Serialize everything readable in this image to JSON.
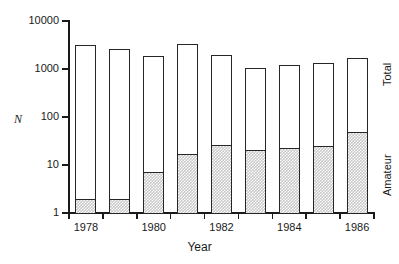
{
  "chart_data": {
    "type": "bar",
    "subtype": "stacked-bar-log-y",
    "title": "",
    "xlabel": "Year",
    "ylabel": "N",
    "ylabel_style": "italic",
    "yscale": "log",
    "ylim": [
      1,
      10000
    ],
    "ytick_labels": [
      "1",
      "10",
      "100",
      "1000",
      "10000"
    ],
    "ytick_values": [
      1,
      10,
      100,
      1000,
      10000
    ],
    "xtick_labels": [
      "1978",
      "1980",
      "1982",
      "1984",
      "1986"
    ],
    "xtick_values": [
      1978,
      1980,
      1982,
      1984,
      1986
    ],
    "categories": [
      1978,
      1979,
      1980,
      1981,
      1982,
      1983,
      1984,
      1985,
      1986
    ],
    "grid": false,
    "legend_position": "right-outside-rotated",
    "series": [
      {
        "name": "Total",
        "label": "Total",
        "fill": "#ffffff",
        "edge": "#262626",
        "values": [
          3200,
          2600,
          1900,
          3300,
          1950,
          1050,
          1200,
          1350,
          1700
        ]
      },
      {
        "name": "Amateur",
        "label": "Amateur",
        "fill": "#c9c9c9",
        "pattern": "checkerboard",
        "edge": "#262626",
        "values": [
          2,
          2,
          7,
          17,
          26,
          21,
          23,
          25,
          48
        ]
      }
    ],
    "annotations": [
      {
        "text": "Total",
        "position": "right-axis-upper",
        "rotation": -90
      },
      {
        "text": "Amateur",
        "position": "right-axis-lower",
        "rotation": -90
      }
    ]
  },
  "axes": {
    "y_title": "N",
    "x_title": "Year",
    "y_ticks": [
      {
        "label": "10000",
        "value": 10000
      },
      {
        "label": "1000",
        "value": 1000
      },
      {
        "label": "100",
        "value": 100
      },
      {
        "label": "10",
        "value": 10
      },
      {
        "label": "1",
        "value": 1
      }
    ],
    "x_ticks": [
      {
        "label": "1978",
        "value": 1978
      },
      {
        "label": "1980",
        "value": 1980
      },
      {
        "label": "1982",
        "value": 1982
      },
      {
        "label": "1984",
        "value": 1984
      },
      {
        "label": "1986",
        "value": 1986
      }
    ]
  },
  "labels": {
    "total": "Total",
    "amateur": "Amateur"
  },
  "colors": {
    "axis": "#1a1a1a",
    "bar_edge": "#262626",
    "total_fill": "#ffffff",
    "amateur_fill": "#c9c9c9",
    "background": "#ffffff"
  }
}
